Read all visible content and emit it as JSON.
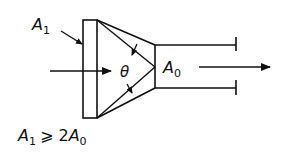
{
  "diagram": {
    "labels": {
      "inlet_area": "A",
      "inlet_area_sub": "1",
      "outlet_area": "A",
      "outlet_area_sub": "0",
      "angle": "θ",
      "condition_a": "A",
      "condition_a_sub": "1",
      "condition_rel": "⩾ 2",
      "condition_b": "A",
      "condition_b_sub": "0"
    },
    "colors": {
      "stroke": "#111111",
      "background": "#ffffff"
    }
  }
}
